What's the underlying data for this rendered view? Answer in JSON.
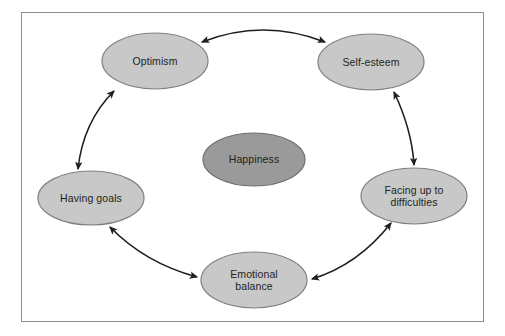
{
  "diagram": {
    "type": "cycle",
    "frame": {
      "stroke": "#8e8e8e"
    },
    "background": "#ffffff",
    "center_node": {
      "id": "happiness",
      "label": "Happiness",
      "fill": "#9a9a9a",
      "stroke": "#6f6f6f",
      "cx": 254,
      "cy": 159.5,
      "rx": 51,
      "ry": 26.5
    },
    "nodes": [
      {
        "id": "optimism",
        "label": "Optimism",
        "fill": "#c8c8c8",
        "stroke": "#808080",
        "cx": 155,
        "cy": 61,
        "rx": 53,
        "ry": 28
      },
      {
        "id": "self-esteem",
        "label": "Self-esteem",
        "fill": "#c8c8c8",
        "stroke": "#808080",
        "cx": 371,
        "cy": 62,
        "rx": 53,
        "ry": 28
      },
      {
        "id": "facing-up-to-difficulties",
        "label": "Facing up to\ndifficulties",
        "fill": "#c8c8c8",
        "stroke": "#808080",
        "cx": 414,
        "cy": 196,
        "rx": 53,
        "ry": 28
      },
      {
        "id": "emotional-balance",
        "label": "Emotional\nbalance",
        "fill": "#c8c8c8",
        "stroke": "#808080",
        "cx": 254,
        "cy": 280,
        "rx": 53,
        "ry": 28
      },
      {
        "id": "having-goals",
        "label": "Having goals",
        "fill": "#c8c8c8",
        "stroke": "#808080",
        "cx": 91,
        "cy": 198,
        "rx": 53,
        "ry": 27
      }
    ],
    "connections": [
      {
        "id": "optimism-self-esteem",
        "from": "optimism",
        "to": "self-esteem",
        "arrow": "both",
        "color": "#231f20"
      },
      {
        "id": "self-esteem-facing-up",
        "from": "self-esteem",
        "to": "facing-up-to-difficulties",
        "arrow": "both",
        "color": "#231f20"
      },
      {
        "id": "facing-up-emotional-balance",
        "from": "facing-up-to-difficulties",
        "to": "emotional-balance",
        "arrow": "both",
        "color": "#231f20"
      },
      {
        "id": "emotional-balance-having-goals",
        "from": "emotional-balance",
        "to": "having-goals",
        "arrow": "both",
        "color": "#231f20"
      },
      {
        "id": "having-goals-optimism",
        "from": "having-goals",
        "to": "optimism",
        "arrow": "both",
        "color": "#231f20"
      }
    ]
  }
}
